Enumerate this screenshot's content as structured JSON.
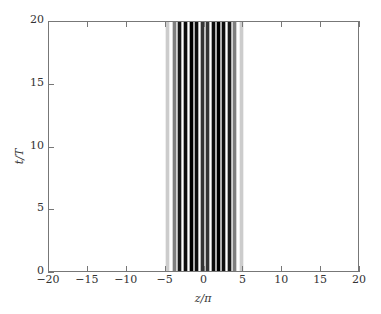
{
  "chart_data": {
    "type": "heatmap",
    "title": "",
    "xlabel": "z/π",
    "ylabel": "t/T",
    "xlim": [
      -20,
      20
    ],
    "ylim": [
      0,
      20
    ],
    "xticks": [
      "-20",
      "-15",
      "-10",
      "-5",
      "0",
      "5",
      "10",
      "15",
      "20"
    ],
    "yticks": [
      "0",
      "5",
      "10",
      "15",
      "20"
    ],
    "grid": false,
    "colormap": "grayscale (black = high intensity)",
    "stripe_positions_z_over_pi": [
      -4.7,
      -3.9,
      -3.2,
      -2.4,
      -1.7,
      -1.0,
      -0.3,
      0.4,
      1.1,
      1.8,
      2.5,
      3.2,
      3.9,
      4.7
    ],
    "stripe_intensity": [
      0.2,
      0.5,
      0.9,
      0.95,
      1.0,
      0.95,
      0.8,
      0.8,
      0.95,
      1.0,
      0.95,
      0.9,
      0.5,
      0.2
    ]
  }
}
